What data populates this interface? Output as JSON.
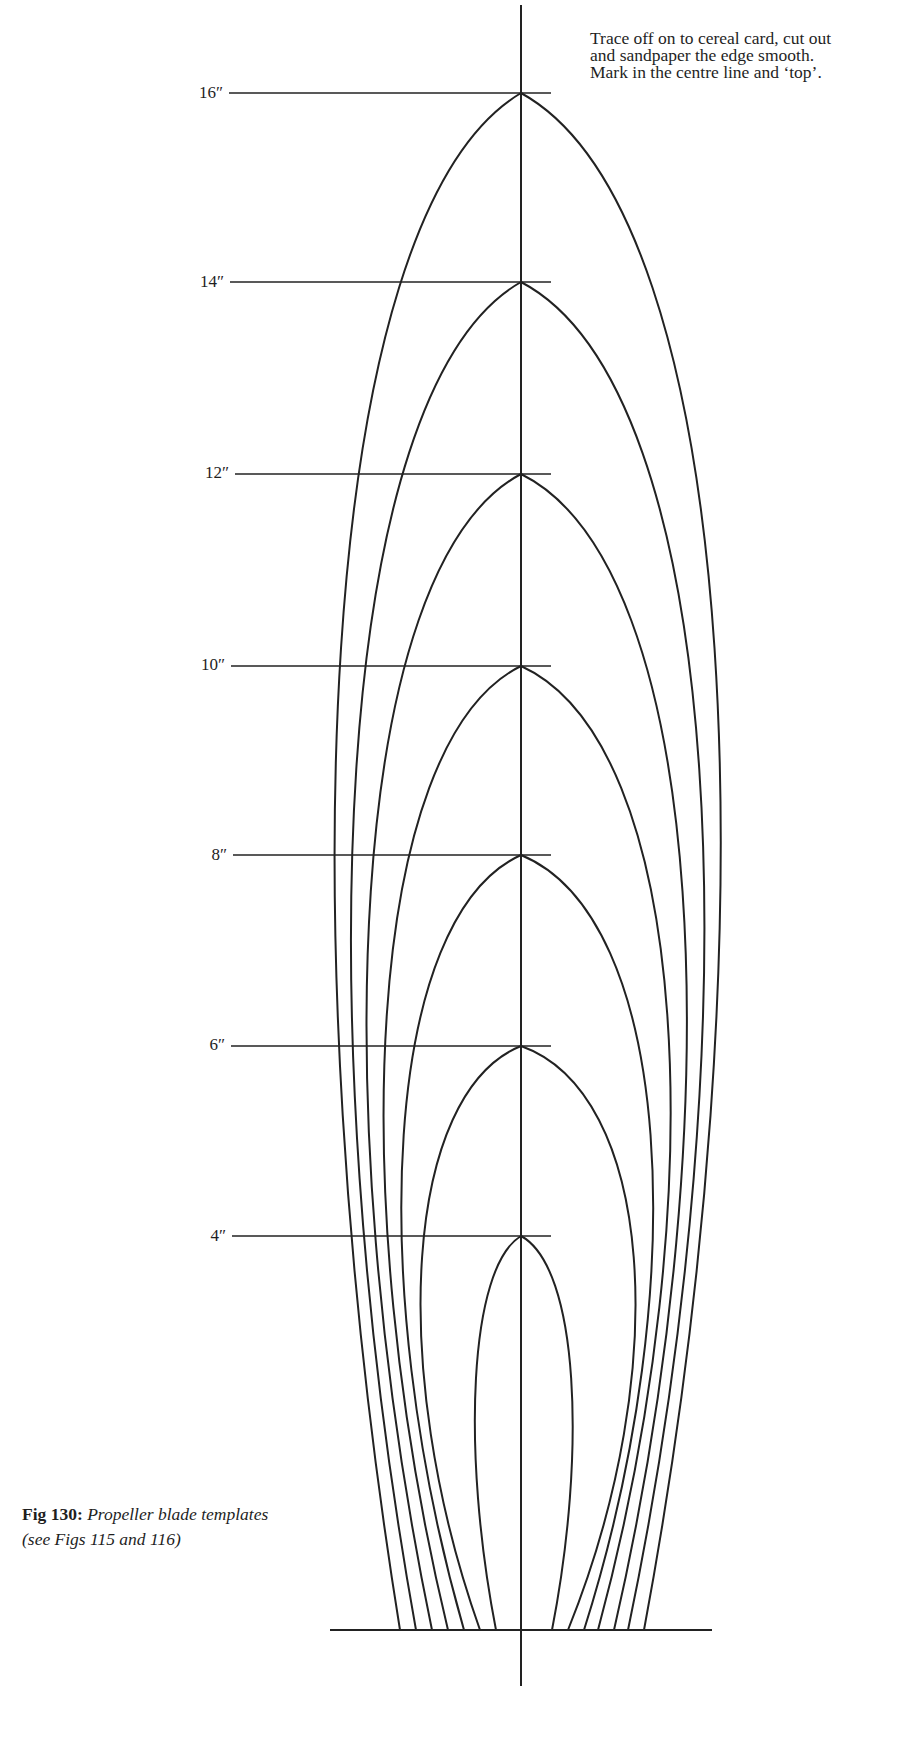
{
  "note": {
    "lines": [
      "Trace off on to cereal card, cut out",
      "and sandpaper the edge smooth.",
      "Mark in the centre line and ‘top’."
    ]
  },
  "caption": {
    "fig_label": "Fig 130:",
    "title": "Propeller blade templates",
    "subtitle": "(see Figs 115 and 116)"
  },
  "stroke_color": "#222222",
  "centre_line": {
    "x": 521,
    "y_top": 5,
    "y_bottom": 1686
  },
  "base_line": {
    "x1": 330,
    "x2": 712,
    "y": 1630
  },
  "templates": [
    {
      "label": "16″",
      "apex_y": 93,
      "label_y": 84,
      "line_x1": 229,
      "left_foot": 400,
      "right_foot": 644,
      "left_max": 303,
      "right_max": 756
    },
    {
      "label": "14″",
      "apex_y": 282,
      "label_y": 273,
      "line_x1": 230,
      "left_foot": 416,
      "right_foot": 628,
      "left_max": 321,
      "right_max": 738
    },
    {
      "label": "12″",
      "apex_y": 474,
      "label_y": 464,
      "line_x1": 235,
      "left_foot": 432,
      "right_foot": 614,
      "left_max": 338,
      "right_max": 718
    },
    {
      "label": "10″",
      "apex_y": 666,
      "label_y": 656,
      "line_x1": 231,
      "left_foot": 448,
      "right_foot": 598,
      "left_max": 357,
      "right_max": 700
    },
    {
      "label": "8″",
      "apex_y": 855,
      "label_y": 846,
      "line_x1": 233,
      "left_foot": 464,
      "right_foot": 584,
      "left_max": 377,
      "right_max": 680
    },
    {
      "label": "6″",
      "apex_y": 1046,
      "label_y": 1036,
      "line_x1": 231,
      "left_foot": 480,
      "right_foot": 568,
      "left_max": 399,
      "right_max": 660
    },
    {
      "label": "4″",
      "apex_y": 1236,
      "label_y": 1227,
      "line_x1": 232,
      "left_foot": 496,
      "right_foot": 552,
      "left_max": 466,
      "right_max": 582
    }
  ],
  "level_line_x2": 551
}
